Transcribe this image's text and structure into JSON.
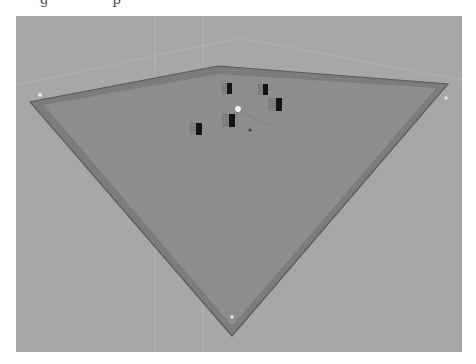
{
  "caption": {
    "fragment_text": "g p"
  },
  "viewport": {
    "name": "3D scene viewport",
    "colors": {
      "background": "#a7a7a7",
      "floor": "#8b8b8b",
      "floor_border": "#7a7a7a",
      "floor_edge": "#5f5f5f",
      "panel": "#141414",
      "panel_shadow": "#6f6f6f",
      "highlight": "#eeeeee",
      "guide_line": "#c9c9c9"
    },
    "floor": {
      "outer": [
        [
          218,
          66
        ],
        [
          448,
          84
        ],
        [
          216,
          326
        ],
        [
          16,
          102
        ]
      ],
      "inner": [
        [
          218,
          74
        ],
        [
          436,
          87
        ],
        [
          216,
          318
        ],
        [
          28,
          105
        ]
      ]
    },
    "objects": [
      {
        "name": "panel-1",
        "x": 196,
        "y": 123,
        "w": 6,
        "h": 12
      },
      {
        "name": "panel-2",
        "x": 227,
        "y": 83,
        "w": 5,
        "h": 11
      },
      {
        "name": "panel-3",
        "x": 263,
        "y": 84,
        "w": 5,
        "h": 11
      },
      {
        "name": "panel-4",
        "x": 276,
        "y": 98,
        "w": 6,
        "h": 13
      },
      {
        "name": "panel-5",
        "x": 229,
        "y": 114,
        "w": 6,
        "h": 13
      }
    ],
    "light_point": {
      "x": 238,
      "y": 110
    },
    "small_marker": {
      "x": 250,
      "y": 130
    },
    "corner_markers": [
      {
        "x": 40,
        "y": 95
      },
      {
        "x": 446,
        "y": 98
      },
      {
        "x": 232,
        "y": 343
      }
    ]
  }
}
